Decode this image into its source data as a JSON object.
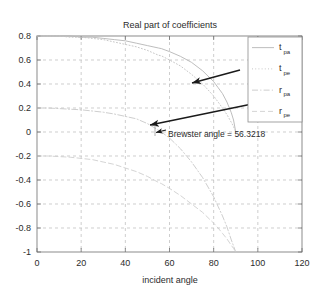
{
  "figure": {
    "title": "Real part of coefficients",
    "background_color": "#ffffff",
    "frame_color": "#6e6e6e",
    "grid_color": "#b9b9b9",
    "text_color": "#2b2b2b"
  },
  "axes": {
    "x": {
      "label": "incident angle",
      "min": 0,
      "max": 120,
      "tick_step": 20,
      "ticks": [
        "0",
        "20",
        "40",
        "60",
        "80",
        "100",
        "120"
      ]
    },
    "y": {
      "label": "",
      "min": -1.0,
      "max": 0.8,
      "tick_step": 0.2,
      "ticks": [
        "0.8",
        "0.6",
        "0.4",
        "0.2",
        "0",
        "-0.2",
        "-0.4",
        "-0.6",
        "-0.8",
        "-1"
      ]
    }
  },
  "legend": {
    "position": "top-right",
    "border_color": "#8d8d8d",
    "entries": [
      {
        "base": "t",
        "sub": "pa",
        "color": "#b5b5b5",
        "dash": "none"
      },
      {
        "base": "t",
        "sub": "pe",
        "color": "#c2c2c2",
        "dash": "dotted"
      },
      {
        "base": "r",
        "sub": "pa",
        "color": "#c8c8c8",
        "dash": "dashdot"
      },
      {
        "base": "r",
        "sub": "pe",
        "color": "#cfcfcf",
        "dash": "dashed"
      }
    ]
  },
  "annotations": [
    {
      "name": "brewster-angle-annotation",
      "text": "Brewster angle = 56.3218",
      "text_x": 168,
      "text_y": 137,
      "arrow": {
        "x1": 240,
        "y1": 70,
        "x2": 192,
        "y2": 83
      },
      "marker_arrow": {
        "x1": 252,
        "y1": 104,
        "x2": 150,
        "y2": 125
      },
      "point_marker": {
        "x": 156,
        "y": 131
      }
    }
  ],
  "chart_data": {
    "type": "line",
    "title": "Real part of coefficients",
    "xlabel": "incident angle",
    "ylabel": "",
    "xlim": [
      0,
      120
    ],
    "ylim": [
      -1.0,
      0.8
    ],
    "grid": true,
    "legend_position": "top-right",
    "brewster_angle": 56.3218,
    "x": [
      0,
      5,
      10,
      15,
      20,
      25,
      30,
      35,
      40,
      45,
      50,
      55,
      56.3218,
      60,
      65,
      70,
      75,
      80,
      82,
      84,
      86,
      88,
      89,
      90
    ],
    "series": [
      {
        "name": "t_pa",
        "label": "t_pa",
        "style": "solid",
        "color": "#b5b5b5",
        "values": [
          0.8,
          0.8,
          0.8,
          0.8,
          0.79,
          0.79,
          0.78,
          0.77,
          0.76,
          0.74,
          0.72,
          0.7,
          0.695,
          0.67,
          0.63,
          0.58,
          0.51,
          0.42,
          0.37,
          0.32,
          0.25,
          0.16,
          0.1,
          0.0
        ]
      },
      {
        "name": "t_pe",
        "label": "t_pe",
        "style": "dotted",
        "color": "#c2c2c2",
        "values": [
          0.8,
          0.8,
          0.8,
          0.79,
          0.79,
          0.78,
          0.77,
          0.75,
          0.73,
          0.71,
          0.68,
          0.64,
          0.635,
          0.6,
          0.55,
          0.48,
          0.4,
          0.3,
          0.25,
          0.2,
          0.145,
          0.08,
          0.045,
          0.0
        ]
      },
      {
        "name": "r_pa",
        "label": "r_pa",
        "style": "dashdot",
        "color": "#c8c8c8",
        "values": [
          0.2,
          0.2,
          0.195,
          0.19,
          0.185,
          0.175,
          0.165,
          0.15,
          0.13,
          0.11,
          0.07,
          0.015,
          0.0,
          -0.05,
          -0.14,
          -0.25,
          -0.38,
          -0.54,
          -0.62,
          -0.7,
          -0.79,
          -0.9,
          -0.95,
          -1.0
        ]
      },
      {
        "name": "r_pe",
        "label": "r_pe",
        "style": "dashed",
        "color": "#cfcfcf",
        "values": [
          -0.2,
          -0.2,
          -0.205,
          -0.21,
          -0.22,
          -0.23,
          -0.25,
          -0.27,
          -0.3,
          -0.33,
          -0.37,
          -0.42,
          -0.43,
          -0.47,
          -0.53,
          -0.6,
          -0.67,
          -0.76,
          -0.8,
          -0.845,
          -0.89,
          -0.945,
          -0.97,
          -1.0
        ]
      }
    ]
  }
}
